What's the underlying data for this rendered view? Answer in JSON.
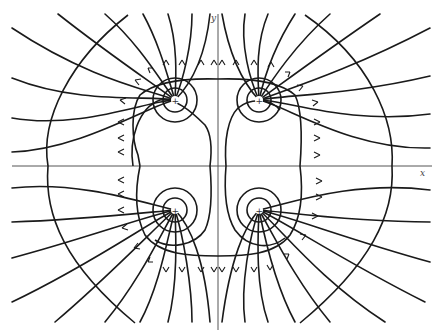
{
  "figure": {
    "axes": {
      "x_label": "x",
      "y_label": "y",
      "origin": [
        218,
        166
      ]
    },
    "charges": [
      {
        "id": "q1",
        "sign": "+",
        "symbol": "+",
        "position": [
          175,
          100
        ]
      },
      {
        "id": "q2",
        "sign": "+",
        "symbol": "+",
        "position": [
          259,
          100
        ]
      },
      {
        "id": "q3",
        "sign": "+",
        "symbol": "+",
        "position": [
          175,
          210
        ]
      },
      {
        "id": "q4",
        "sign": "+",
        "symbol": "+",
        "position": [
          259,
          210
        ]
      }
    ],
    "colors": {
      "line": "#1a1a1a",
      "axis": "#555555",
      "background": "#ffffff"
    }
  }
}
